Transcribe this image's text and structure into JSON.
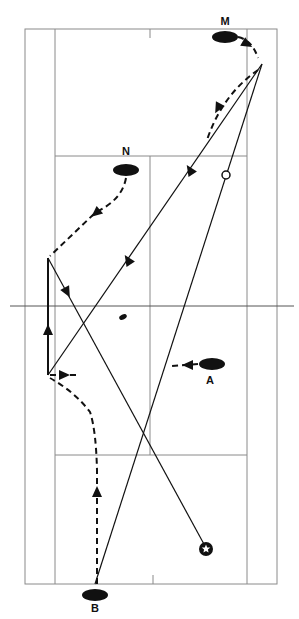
{
  "diagram": {
    "colors": {
      "line": "#111111",
      "court": "#8a8a8a",
      "background": "#ffffff"
    },
    "court": {
      "outer": {
        "left": 25,
        "top": 29,
        "right": 277,
        "bottom": 584
      },
      "singles_left": 55,
      "singles_right": 247,
      "center_x": 150,
      "short_service_top": 156,
      "short_service_bottom": 455,
      "net": {
        "y": 306,
        "x1": 10,
        "x2": 294
      },
      "center_ticks": [
        {
          "x": 150,
          "y1": 29,
          "y2": 38
        },
        {
          "x": 153,
          "y1": 575,
          "y2": 584
        }
      ]
    },
    "players": [
      {
        "label": "M",
        "cx": 225,
        "cy": 37,
        "rx": 13,
        "ry": 6,
        "label_x": 225,
        "label_y": 16
      },
      {
        "label": "N",
        "cx": 126,
        "cy": 170,
        "rx": 13,
        "ry": 6,
        "label_x": 126,
        "label_y": 146
      },
      {
        "label": "A",
        "cx": 212,
        "cy": 364,
        "rx": 13,
        "ry": 6,
        "label_x": 210,
        "label_y": 375
      },
      {
        "label": "B",
        "cx": 95,
        "cy": 595,
        "rx": 13,
        "ry": 6,
        "label_x": 95,
        "label_y": 603
      }
    ],
    "shuttle_paths": [
      {
        "name": "shot-1",
        "from": [
          95,
          584
        ],
        "to": [
          262,
          64
        ]
      },
      {
        "name": "shot-2",
        "from": [
          262,
          64
        ],
        "to": [
          48,
          375
        ],
        "arrows": [
          [
            190,
            170,
            237
          ],
          [
            128,
            260,
            237
          ]
        ]
      },
      {
        "name": "shot-3",
        "from": [
          48,
          375
        ],
        "to": [
          48,
          258
        ],
        "arrows": [
          [
            48,
            330,
            270
          ]
        ],
        "thick": true
      },
      {
        "name": "shot-4",
        "from": [
          48,
          258
        ],
        "to": [
          205,
          546
        ],
        "arrows": [
          [
            67,
            292,
            62
          ]
        ]
      }
    ],
    "movement_paths": [
      {
        "name": "m-move-1",
        "d": "M238,37 Q252,40 258,58",
        "arrow": [
          247,
          44,
          30
        ]
      },
      {
        "name": "m-move-2",
        "d": "M258,70 Q222,95 207,140",
        "arrow": [
          218,
          108,
          118
        ]
      },
      {
        "name": "n-move",
        "d": "M126,178 Q122,200 96,212 L50,256",
        "arrow": [
          96,
          213,
          140
        ]
      },
      {
        "name": "b-move",
        "d": "M97,584 L97,470 Q96,430 90,412 Q75,392 50,378",
        "arrow": [
          97,
          492,
          270
        ]
      },
      {
        "name": "a-move",
        "d": "M198,364 L172,366",
        "arrow": [
          188,
          365,
          180
        ]
      },
      {
        "name": "rear-move",
        "d": "M50,375 L80,375",
        "arrow": [
          64,
          375,
          0
        ]
      }
    ],
    "markers": {
      "open_circle": {
        "cx": 226,
        "cy": 175,
        "r": 4
      },
      "star_target": {
        "cx": 206,
        "cy": 549,
        "r": 7
      },
      "shuttle_blob": {
        "cx": 123,
        "cy": 317
      }
    }
  }
}
